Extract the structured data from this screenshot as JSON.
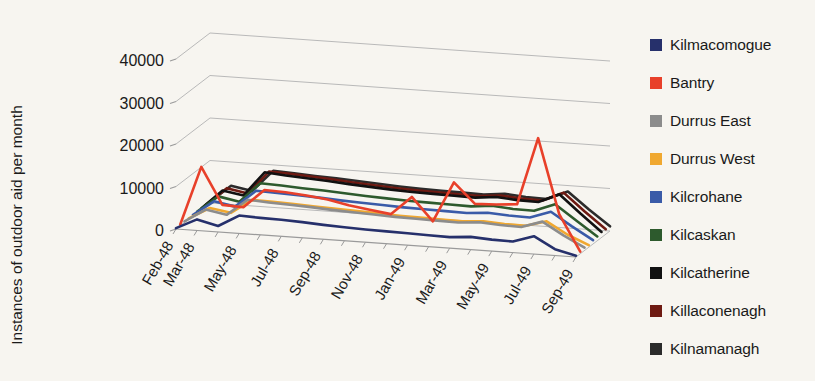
{
  "chart_data": {
    "type": "line",
    "title": "",
    "subtitle": "",
    "xlabel": "",
    "ylabel": "Instances of outdoor aid per month",
    "ylim": [
      0,
      45000
    ],
    "yticks": [
      0,
      10000,
      20000,
      30000,
      40000
    ],
    "ytick_labels": [
      "0",
      "10000",
      "20000",
      "30000",
      "40000"
    ],
    "grid": true,
    "grid_axis": "y",
    "projection": "3d-perspective",
    "legend_position": "right",
    "x": [
      "Feb-48",
      "Mar-48",
      "Apr-48",
      "May-48",
      "Jun-48",
      "Jul-48",
      "Aug-48",
      "Sep-48",
      "Oct-48",
      "Nov-48",
      "Dec-48",
      "Jan-49",
      "Feb-49",
      "Mar-49",
      "Apr-49",
      "May-49",
      "Jun-49",
      "Jul-49",
      "Aug-49",
      "Sep-49"
    ],
    "xtick_labels": [
      "Feb-48",
      "Mar-48",
      "May-48",
      "Jul-48",
      "Sep-48",
      "Nov-48",
      "Jan-49",
      "Mar-49",
      "May-49",
      "Jul-49",
      "Sep-49"
    ],
    "xtick_indices": [
      0,
      1,
      3,
      5,
      7,
      9,
      11,
      13,
      15,
      17,
      19
    ],
    "series": [
      {
        "name": "Kilmacomogue",
        "color": "#26306B",
        "values": [
          200,
          2600,
          1400,
          4200,
          4000,
          3900,
          3700,
          3400,
          3200,
          3000,
          2900,
          2800,
          2700,
          2600,
          3000,
          2700,
          2600,
          4200,
          1500,
          300
        ]
      },
      {
        "name": "Bantry",
        "color": "#E8402A",
        "values": [
          300,
          14200,
          5600,
          5400,
          9800,
          9600,
          9200,
          8600,
          7600,
          6900,
          6200,
          10600,
          5200,
          14700,
          10000,
          10200,
          10600,
          26500,
          9000,
          500
        ]
      },
      {
        "name": "Durrus East",
        "color": "#8C8C8C",
        "values": [
          250,
          3400,
          2500,
          6400,
          6100,
          5900,
          5700,
          5400,
          5200,
          5000,
          4800,
          4700,
          4600,
          4500,
          4900,
          4600,
          4500,
          6100,
          3200,
          700
        ]
      },
      {
        "name": "Durrus West",
        "color": "#F0A830",
        "values": [
          220,
          3000,
          2200,
          5600,
          5500,
          5300,
          5100,
          4900,
          4700,
          4500,
          4300,
          4200,
          4100,
          4000,
          4400,
          4100,
          4000,
          5400,
          2600,
          500
        ]
      },
      {
        "name": "Kilcrohane",
        "color": "#3A5BA8",
        "values": [
          260,
          3800,
          2900,
          7000,
          6800,
          6600,
          6400,
          6100,
          5900,
          5700,
          5500,
          5400,
          5300,
          5200,
          5600,
          5300,
          5200,
          6900,
          3800,
          900
        ]
      },
      {
        "name": "Kilcaskan",
        "color": "#2D5A2D",
        "values": [
          280,
          4200,
          3300,
          8000,
          7800,
          7500,
          7300,
          7000,
          6700,
          6500,
          6300,
          6200,
          6100,
          6000,
          6500,
          6100,
          6000,
          7900,
          4400,
          1000
        ]
      },
      {
        "name": "Kilcatherine",
        "color": "#111111",
        "values": [
          320,
          4800,
          4000,
          9800,
          9400,
          9100,
          8800,
          8400,
          8100,
          7800,
          7600,
          7500,
          7400,
          7300,
          7800,
          7400,
          7300,
          9500,
          5300,
          1300
        ]
      },
      {
        "name": "Killaconenagh",
        "color": "#6E1A12",
        "values": [
          310,
          4600,
          3700,
          9200,
          9000,
          8700,
          8400,
          8000,
          7700,
          7400,
          7200,
          7100,
          7000,
          6900,
          7400,
          7000,
          6900,
          9100,
          5000,
          1200
        ]
      },
      {
        "name": "Kilnamanagh",
        "color": "#2B2B2B",
        "values": [
          300,
          4400,
          3500,
          8600,
          8400,
          8100,
          7900,
          7600,
          7300,
          7000,
          6800,
          6700,
          6600,
          6500,
          7000,
          6600,
          6500,
          8600,
          4700,
          1100
        ]
      }
    ]
  },
  "axis": {
    "ylabel": "Instances of outdoor aid per month"
  },
  "legend": {
    "items": [
      {
        "label": "Kilmacomogue",
        "color": "#26306B"
      },
      {
        "label": "Bantry",
        "color": "#E8402A"
      },
      {
        "label": "Durrus East",
        "color": "#8C8C8C"
      },
      {
        "label": "Durrus West",
        "color": "#F0A830"
      },
      {
        "label": "Kilcrohane",
        "color": "#3A5BA8"
      },
      {
        "label": "Kilcaskan",
        "color": "#2D5A2D"
      },
      {
        "label": "Kilcatherine",
        "color": "#111111"
      },
      {
        "label": "Killaconenagh",
        "color": "#6E1A12"
      },
      {
        "label": "Kilnamanagh",
        "color": "#2B2B2B"
      }
    ]
  }
}
